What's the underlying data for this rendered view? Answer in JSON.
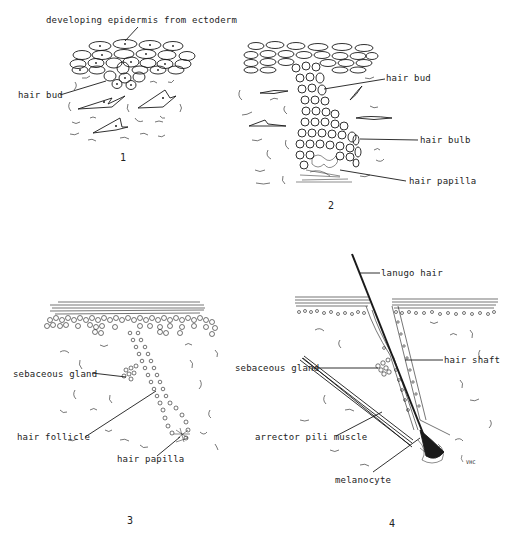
{
  "figure": {
    "panels": [
      {
        "number": "1",
        "labels": {
          "epidermis": "developing epidermis from ectoderm",
          "hair_bud": "hair bud"
        }
      },
      {
        "number": "2",
        "labels": {
          "hair_bud": "hair bud",
          "hair_bulb": "hair bulb",
          "hair_papilla": "hair papilla"
        }
      },
      {
        "number": "3",
        "labels": {
          "sebaceous_gland": "sebaceous gland",
          "hair_follicle": "hair follicle",
          "hair_papilla": "hair papilla"
        }
      },
      {
        "number": "4",
        "labels": {
          "lanugo_hair": "lanugo hair",
          "hair_shaft": "hair shaft",
          "sebaceous_gland": "sebaceous gland",
          "arrector_pili_muscle": "arrector pili muscle",
          "melanocyte": "melanocyte"
        },
        "signature": "VHC"
      }
    ],
    "colors": {
      "ink": "#1a1a1a",
      "background": "#ffffff"
    }
  }
}
